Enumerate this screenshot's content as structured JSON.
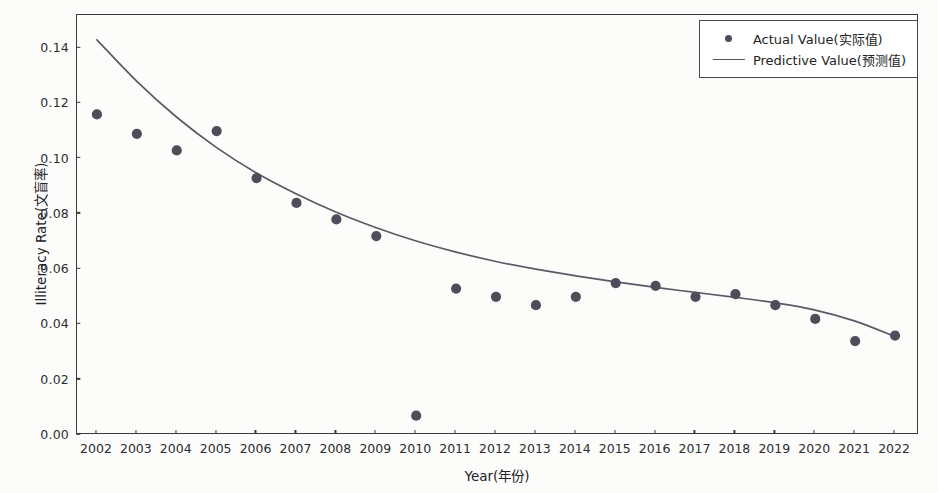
{
  "chart_data": {
    "type": "scatter",
    "title": "",
    "xlabel": "Year(年份)",
    "ylabel": "Illiteracy Rate(文盲率)",
    "x": [
      2002,
      2003,
      2004,
      2005,
      2006,
      2007,
      2008,
      2009,
      2010,
      2011,
      2012,
      2013,
      2014,
      2015,
      2016,
      2017,
      2018,
      2019,
      2020,
      2021,
      2022
    ],
    "xtick_labels": [
      "2002",
      "2003",
      "2004",
      "2005",
      "2006",
      "2007",
      "2008",
      "2009",
      "2010",
      "2011",
      "2012",
      "2013",
      "2014",
      "2015",
      "2016",
      "2017",
      "2018",
      "2019",
      "2020",
      "2021",
      "2022"
    ],
    "ytick_labels": [
      "0.00",
      "0.02",
      "0.04",
      "0.06",
      "0.08",
      "0.10",
      "0.12",
      "0.14"
    ],
    "ytick_values": [
      0.0,
      0.02,
      0.04,
      0.06,
      0.08,
      0.1,
      0.12,
      0.14
    ],
    "xlim": [
      2001.5,
      2022.6
    ],
    "ylim": [
      0.0,
      0.152
    ],
    "grid": false,
    "legend_position": "upper right",
    "series": [
      {
        "name": "Actual Value(实际值)",
        "style": "scatter",
        "marker": "circle",
        "color": "#4e4e5a",
        "values": [
          0.116,
          0.109,
          0.103,
          0.11,
          0.093,
          0.084,
          0.078,
          0.072,
          0.007,
          0.053,
          0.05,
          0.047,
          0.05,
          0.055,
          0.054,
          0.05,
          0.051,
          0.047,
          0.042,
          0.034,
          0.036
        ]
      },
      {
        "name": "Predictive Value(预测值)",
        "style": "line",
        "color": "#5a5a66",
        "values": [
          0.143,
          0.128,
          0.115,
          0.104,
          0.0948,
          0.0872,
          0.0806,
          0.075,
          0.0702,
          0.0662,
          0.0628,
          0.06,
          0.0576,
          0.0554,
          0.0534,
          0.0516,
          0.0498,
          0.0478,
          0.0452,
          0.0412,
          0.0356
        ]
      }
    ]
  },
  "legend": {
    "items": [
      {
        "label": "Actual Value(实际值)",
        "key": "scatter-marker"
      },
      {
        "label": "Predictive Value(预测值)",
        "key": "line-marker"
      }
    ]
  }
}
